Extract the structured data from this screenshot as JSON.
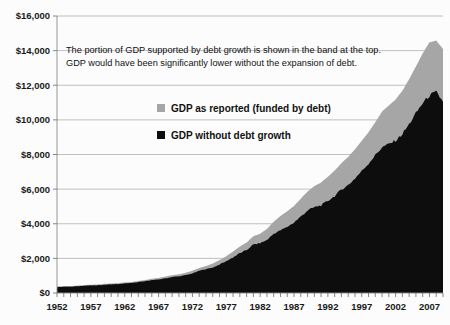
{
  "chart_data": {
    "type": "area",
    "title": "",
    "xlabel": "",
    "ylabel": "",
    "stacked": true,
    "grid": true,
    "legend_position": "inside-upper-left",
    "xlim": [
      1952,
      2009
    ],
    "ylim": [
      0,
      16000
    ],
    "y_ticks": [
      0,
      2000,
      4000,
      6000,
      8000,
      10000,
      12000,
      14000,
      16000
    ],
    "y_tick_labels": [
      "$0",
      "$2,000",
      "$4,000",
      "$6,000",
      "$8,000",
      "$10,000",
      "$12,000",
      "$14,000",
      "$16,000"
    ],
    "x_ticks": [
      1952,
      1957,
      1962,
      1967,
      1972,
      1977,
      1982,
      1987,
      1992,
      1997,
      2002,
      2007
    ],
    "x_tick_labels": [
      "1952",
      "1957",
      "1962",
      "1967",
      "1972",
      "1977",
      "1982",
      "1987",
      "1992",
      "1997",
      "2002",
      "2007"
    ],
    "x_minor_tick_interval": 1,
    "annotation": {
      "line1": "The portion of GDP supported by debt growth is shown in the band at the top.",
      "line2": "GDP would have been significantly lower without the expansion of debt."
    },
    "series": [
      {
        "name": "GDP as reported (funded by debt)",
        "color": "#a6a6a6",
        "legend_label": "GDP as reported (funded by debt)",
        "x": [
          1952,
          1953,
          1954,
          1955,
          1956,
          1957,
          1958,
          1959,
          1960,
          1961,
          1962,
          1963,
          1964,
          1965,
          1966,
          1967,
          1968,
          1969,
          1970,
          1971,
          1972,
          1973,
          1974,
          1975,
          1976,
          1977,
          1978,
          1979,
          1980,
          1981,
          1982,
          1983,
          1984,
          1985,
          1986,
          1987,
          1988,
          1989,
          1990,
          1991,
          1992,
          1993,
          1994,
          1995,
          1996,
          1997,
          1998,
          1999,
          2000,
          2001,
          2002,
          2003,
          2004,
          2005,
          2006,
          2007,
          2008,
          2009
        ],
        "values": [
          380,
          400,
          400,
          430,
          460,
          480,
          490,
          530,
          550,
          570,
          610,
          640,
          690,
          750,
          820,
          870,
          950,
          1030,
          1080,
          1170,
          1290,
          1440,
          1560,
          1700,
          1900,
          2120,
          2400,
          2680,
          2920,
          3280,
          3420,
          3700,
          4120,
          4450,
          4720,
          5030,
          5450,
          5860,
          6180,
          6380,
          6720,
          7070,
          7500,
          7860,
          8300,
          8790,
          9280,
          9860,
          10480,
          10830,
          11180,
          11680,
          12350,
          13090,
          13840,
          14480,
          14580,
          14100
        ]
      },
      {
        "name": "GDP without debt growth",
        "color": "#0d0d0d",
        "legend_label": "GDP without debt growth",
        "x": [
          1952,
          1953,
          1954,
          1955,
          1956,
          1957,
          1958,
          1959,
          1960,
          1961,
          1962,
          1963,
          1964,
          1965,
          1966,
          1967,
          1968,
          1969,
          1970,
          1971,
          1972,
          1973,
          1974,
          1975,
          1976,
          1977,
          1978,
          1979,
          1980,
          1981,
          1982,
          1983,
          1984,
          1985,
          1986,
          1987,
          1988,
          1989,
          1990,
          1991,
          1992,
          1993,
          1994,
          1995,
          1996,
          1997,
          1998,
          1999,
          2000,
          2001,
          2002,
          2003,
          2004,
          2005,
          2006,
          2007,
          2008,
          2009
        ],
        "values": [
          340,
          360,
          362,
          390,
          420,
          438,
          440,
          478,
          500,
          515,
          552,
          580,
          625,
          680,
          745,
          782,
          850,
          920,
          960,
          1030,
          1130,
          1280,
          1380,
          1470,
          1650,
          1830,
          2060,
          2300,
          2480,
          2800,
          2880,
          3060,
          3420,
          3620,
          3820,
          4070,
          4420,
          4760,
          4960,
          5060,
          5320,
          5600,
          5980,
          6230,
          6620,
          7050,
          7480,
          7960,
          8420,
          8600,
          8800,
          9180,
          9750,
          10380,
          10960,
          11400,
          11600,
          11050
        ]
      }
    ]
  },
  "legend": {
    "items": [
      {
        "label": "GDP as reported (funded by debt)",
        "color": "#a6a6a6"
      },
      {
        "label": "GDP without debt growth",
        "color": "#0d0d0d"
      }
    ]
  }
}
